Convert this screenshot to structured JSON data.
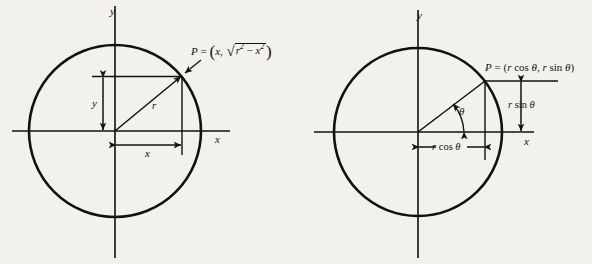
{
  "figure": {
    "background_color": "#f2f1ed",
    "ink_color": "#111111",
    "caption": "",
    "panels": [
      {
        "id": "cartesian",
        "name": "circle-cartesian-coordinates",
        "axis_labels": {
          "x": "x",
          "y": "y"
        },
        "point_label": {
          "prefix": "P",
          "equals": "=",
          "open_paren": "(",
          "first_coord": "x",
          "comma": ",",
          "radical_sign": "√",
          "radicand_base_1": "r",
          "radicand_exp_1": "2",
          "radicand_op": "−",
          "radicand_base_2": "x",
          "radicand_exp_2": "2",
          "close_paren": ")",
          "full_text": "P = (x, √(r² − x²))"
        },
        "dimension_labels": [
          {
            "name": "vertical-dimension",
            "text": "y",
            "orientation": "vertical"
          },
          {
            "name": "horizontal-dimension",
            "text": "x",
            "orientation": "horizontal"
          },
          {
            "name": "radius-label",
            "text": "r",
            "orientation": "diagonal"
          }
        ],
        "geometry": {
          "center": [
            115,
            131
          ],
          "radius": 86,
          "point_P": [
            182,
            76
          ],
          "x_axis_y": 131,
          "y_axis_x": 115
        }
      },
      {
        "id": "polar",
        "name": "circle-polar-coordinates",
        "axis_labels": {
          "x": "x",
          "y": "y"
        },
        "point_label": {
          "prefix": "P",
          "equals": "=",
          "open_paren": "(",
          "first_coord_r": "r",
          "first_coord_fn": "cos",
          "first_coord_theta": "θ",
          "comma": ",",
          "second_coord_r": "r",
          "second_coord_fn": "sin",
          "second_coord_theta": "θ",
          "close_paren": ")",
          "full_text": "P = (r cos θ, r sin θ)"
        },
        "dimension_labels": [
          {
            "name": "vertical-dimension",
            "r": "r",
            "fn": "sin",
            "theta": "θ",
            "text": "r sin θ",
            "orientation": "vertical"
          },
          {
            "name": "horizontal-dimension",
            "r": "r",
            "fn": "cos",
            "theta": "θ",
            "text": "r cos θ",
            "orientation": "horizontal"
          }
        ],
        "angle_label": {
          "name": "theta-angle",
          "text": "θ"
        },
        "geometry": {
          "center": [
            122,
            132
          ],
          "radius": 84,
          "point_P": [
            189,
            81
          ],
          "x_axis_y": 132,
          "y_axis_x": 122
        }
      }
    ]
  }
}
